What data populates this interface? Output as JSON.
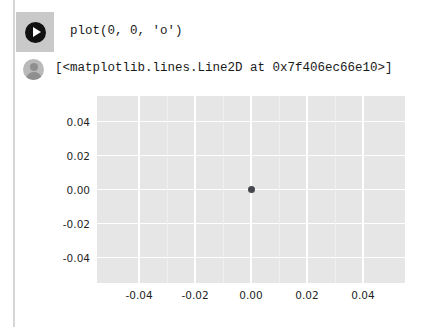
{
  "cell": {
    "run_button": {
      "icon": "play-icon",
      "label": "Run cell"
    },
    "code": "plot(0, 0, 'o')",
    "output_avatar_icon": "user-avatar-icon",
    "output_text": "[<matplotlib.lines.Line2D at 0x7f406ec66e10>]"
  },
  "colors": {
    "axes_background": "#e6e6e6",
    "gridline": "#ffffff",
    "marker": "#47474f",
    "run_button_background": "#c9c9c9",
    "avatar": "#b9b9b9",
    "cell_border": "#d6d6d6",
    "text": "#1a1a1a"
  },
  "chart_data": {
    "type": "scatter",
    "title": "",
    "xlabel": "",
    "ylabel": "",
    "xlim": [
      -0.055,
      0.055
    ],
    "ylim": [
      -0.055,
      0.055
    ],
    "grid": true,
    "legend": null,
    "xticks": [
      -0.04,
      -0.02,
      0.0,
      0.02,
      0.04
    ],
    "yticks": [
      -0.04,
      -0.02,
      0.0,
      0.02,
      0.04
    ],
    "xticklabels": [
      "-0.04",
      "-0.02",
      "0.00",
      "0.02",
      "0.04"
    ],
    "yticklabels": [
      "-0.04",
      "-0.02",
      "0.00",
      "0.02",
      "0.04"
    ],
    "series": [
      {
        "name": "Line2D",
        "marker": "o",
        "x": [
          0.0
        ],
        "y": [
          0.0
        ]
      }
    ]
  }
}
